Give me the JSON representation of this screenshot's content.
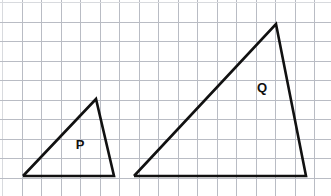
{
  "figure": {
    "width": 331,
    "height": 196,
    "background_color": "#ffffff"
  },
  "grid": {
    "cell_size_px": 19.5,
    "origin_x": 2,
    "origin_y": 2,
    "columns": 17,
    "rows": 10,
    "line_color": "#b9bcc4",
    "faint_line_color": "#d8dade",
    "line_width": 1
  },
  "shapes": [
    {
      "id": "triangle-p",
      "label": "P",
      "label_position": {
        "x": 80,
        "y": 146
      },
      "stroke_color": "#111111",
      "stroke_width": 2.6,
      "fill": "none",
      "vertices": [
        {
          "name": "bottom-left",
          "x": 23,
          "y": 176
        },
        {
          "name": "apex",
          "x": 96,
          "y": 99
        },
        {
          "name": "bottom-right",
          "x": 114,
          "y": 176
        }
      ],
      "points_attr": "23,176 96,99 114,176 23,176",
      "grid_units": {
        "base_width": 4.7,
        "height": 4.0
      }
    },
    {
      "id": "triangle-q",
      "label": "Q",
      "label_position": {
        "x": 262,
        "y": 89
      },
      "stroke_color": "#111111",
      "stroke_width": 2.6,
      "fill": "none",
      "vertices": [
        {
          "name": "bottom-left",
          "x": 134,
          "y": 176
        },
        {
          "name": "apex",
          "x": 276,
          "y": 24
        },
        {
          "name": "bottom-right",
          "x": 306,
          "y": 176
        }
      ],
      "points_attr": "134,176 276,24 306,176 134,176",
      "grid_units": {
        "base_width": 8.8,
        "height": 7.8
      }
    }
  ],
  "chart_data": {
    "type": "scatter",
    "xlabel": "",
    "ylabel": "",
    "xlim": [
      0,
      17
    ],
    "ylim": [
      0,
      10
    ],
    "grid": true,
    "legend": "none",
    "series": [
      {
        "name": "P",
        "x": [
          1.1,
          4.8,
          5.7,
          1.1
        ],
        "y": [
          1.0,
          5.0,
          1.0,
          1.0
        ]
      },
      {
        "name": "Q",
        "x": [
          6.8,
          14.0,
          15.6,
          6.8
        ],
        "y": [
          1.0,
          8.8,
          1.0,
          6.8
        ]
      }
    ],
    "annotations": [
      {
        "text": "P",
        "x": 4.0,
        "y": 2.5
      },
      {
        "text": "Q",
        "x": 13.3,
        "y": 5.0
      }
    ]
  }
}
